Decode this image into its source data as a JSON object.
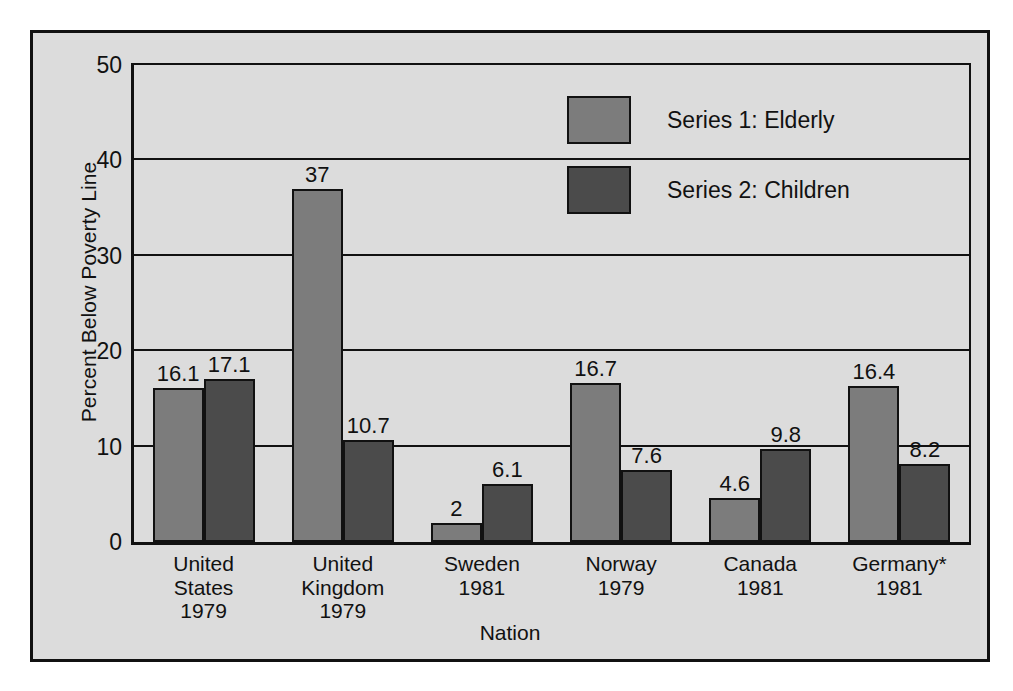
{
  "chart_data": {
    "type": "bar",
    "title": "",
    "xlabel": "Nation",
    "ylabel": "Percent Below Poverty Line",
    "ylim": [
      0,
      50
    ],
    "ytick_values": [
      0,
      10,
      20,
      30,
      40,
      50
    ],
    "ytick_labels": [
      "0",
      "10",
      "20",
      "30",
      "40",
      "50"
    ],
    "grid": "horizontal",
    "legend_position": "upper-center-right",
    "categories": [
      "United\nStates\n1979",
      "United\nKingdom\n1979",
      "Sweden\n1981",
      "Norway\n1979",
      "Canada\n1981",
      "Germany*\n1981"
    ],
    "category_lines": [
      [
        "United",
        "States",
        "1979"
      ],
      [
        "United",
        "Kingdom",
        "1979"
      ],
      [
        "Sweden",
        "1981"
      ],
      [
        "Norway",
        "1979"
      ],
      [
        "Canada",
        "1981"
      ],
      [
        "Germany*",
        "1981"
      ]
    ],
    "series": [
      {
        "name": "Series 1: Elderly",
        "color": "#7c7c7c",
        "values": [
          16.1,
          37,
          2,
          16.7,
          4.6,
          16.4
        ],
        "labels": [
          "16.1",
          "37",
          "2",
          "16.7",
          "4.6",
          "16.4"
        ]
      },
      {
        "name": "Series 2: Children",
        "color": "#4b4b4b",
        "values": [
          17.1,
          10.7,
          6.1,
          7.6,
          9.8,
          8.2
        ],
        "labels": [
          "17.1",
          "10.7",
          "6.1",
          "7.6",
          "9.8",
          "8.2"
        ]
      }
    ]
  },
  "legend": {
    "items": [
      {
        "label": "Series 1: Elderly",
        "color": "#7c7c7c"
      },
      {
        "label": "Series 2: Children",
        "color": "#4b4b4b"
      }
    ]
  },
  "axes": {
    "y_title": "Percent Below Poverty Line",
    "x_title": "Nation"
  },
  "colors": {
    "background": "#dcdcdc",
    "frame": "#111111",
    "series1": "#7c7c7c",
    "series2": "#4b4b4b"
  }
}
